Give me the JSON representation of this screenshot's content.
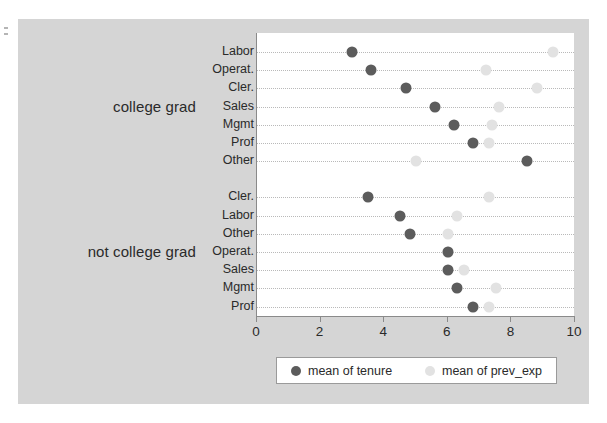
{
  "chart_data": {
    "type": "scatter",
    "title": "",
    "subtitle": "",
    "xlabel": "",
    "ylabel": "",
    "xlim": [
      0,
      10
    ],
    "xticks": [
      0,
      2,
      4,
      6,
      8,
      10
    ],
    "xticklabels": [
      "0",
      "2",
      "4",
      "6",
      "8",
      "10"
    ],
    "grid": true,
    "grid_style": "dotted-horizontal",
    "legend_position": "bottom",
    "legend": [
      "mean of tenure",
      "mean of prev_exp"
    ],
    "series": [
      {
        "name": "mean of tenure",
        "color": "#5c5c5c",
        "marker": "circle"
      },
      {
        "name": "mean of prev_exp",
        "color": "#e2e2e2",
        "marker": "circle"
      }
    ],
    "groups": [
      {
        "label": "college grad",
        "categories": [
          "Labor",
          "Operat.",
          "Cler.",
          "Sales",
          "Mgmt",
          "Prof",
          "Other"
        ],
        "mean_of_tenure": [
          3.0,
          3.6,
          4.7,
          5.6,
          6.2,
          6.8,
          8.5
        ],
        "mean_of_prev_exp": [
          9.3,
          7.2,
          8.8,
          7.6,
          7.4,
          7.3,
          5.0
        ]
      },
      {
        "label": "not college grad",
        "categories": [
          "Cler.",
          "Labor",
          "Other",
          "Operat.",
          "Sales",
          "Mgmt",
          "Prof"
        ],
        "mean_of_tenure": [
          3.5,
          4.5,
          4.8,
          6.0,
          6.0,
          6.3,
          6.8
        ],
        "mean_of_prev_exp": [
          7.3,
          6.3,
          6.0,
          6.0,
          6.5,
          7.5,
          7.3
        ]
      }
    ]
  },
  "colors": {
    "background": "#d5d5d5",
    "panel": "#ffffff",
    "tenure": "#5c5c5c",
    "prev_exp": "#e2e2e2",
    "axis": "#8a8a8a",
    "gridline": "#b9b9b9",
    "text": "#2a2a2a"
  }
}
